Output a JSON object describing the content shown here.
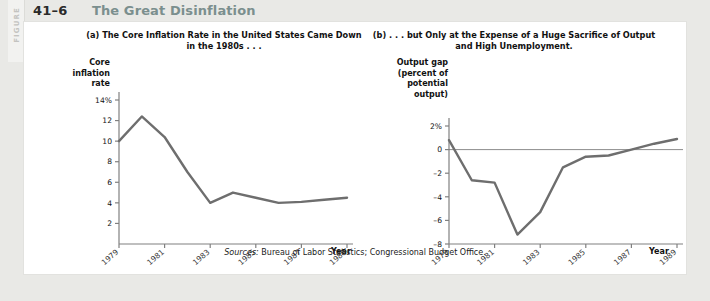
{
  "header": {
    "figure_word": "FIGURE",
    "figure_number": "41–6",
    "figure_title": "The Great Disinflation"
  },
  "source_note": {
    "label": "Sources:",
    "text": " Bureau of Labor Statistics; Congressional Budget Office."
  },
  "panel_a": {
    "title": "(a) The Core Inflation Rate in the United States Came Down in the 1980s . . .",
    "y_caption": "Core inflation rate",
    "x_caption": "Year"
  },
  "panel_b": {
    "title": "(b) . . . but Only at the Expense of a Huge Sacrifice of Output and High Unemployment.",
    "y_caption": "Output gap (percent of potential output)",
    "x_caption": "Year"
  },
  "colors": {
    "line": "#6e6e6e",
    "axis": "#808080",
    "card": "#ffffff",
    "page": "#e9e9e6",
    "title_accent": "#7b8f8e",
    "figure_word": "#c3c3c0"
  },
  "chart_data": [
    {
      "type": "line",
      "title": "(a) The Core Inflation Rate in the United States Came Down in the 1980s . . .",
      "xlabel": "Year",
      "ylabel": "Core inflation rate",
      "xlim": [
        1979,
        1989
      ],
      "ylim": [
        0,
        14
      ],
      "yticks": [
        2,
        4,
        6,
        8,
        10,
        12,
        14
      ],
      "ytick_labels": [
        "2",
        "4",
        "6",
        "8",
        "10",
        "12",
        "14%"
      ],
      "xticks": [
        1979,
        1981,
        1983,
        1985,
        1987,
        1989
      ],
      "xtick_labels": [
        "1979",
        "1981",
        "1983",
        "1985",
        "1987",
        "1989"
      ],
      "grid": false,
      "legend": "none",
      "x": [
        1979,
        1980,
        1981,
        1982,
        1983,
        1984,
        1985,
        1986,
        1987,
        1988,
        1989
      ],
      "values": [
        10.0,
        12.4,
        10.4,
        7.0,
        4.0,
        5.0,
        4.5,
        4.0,
        4.1,
        4.3,
        4.5
      ]
    },
    {
      "type": "line",
      "title": "(b) . . . but Only at the Expense of a Huge Sacrifice of Output and High Unemployment.",
      "xlabel": "Year",
      "ylabel": "Output gap (percent of potential output)",
      "xlim": [
        1979,
        1989
      ],
      "ylim": [
        -8,
        2
      ],
      "yticks": [
        -8,
        -6,
        -4,
        -2,
        0,
        2
      ],
      "ytick_labels": [
        "–8",
        "–6",
        "–4",
        "–2",
        "0",
        "2%"
      ],
      "xticks": [
        1979,
        1981,
        1983,
        1985,
        1987,
        1989
      ],
      "xtick_labels": [
        "1979",
        "1981",
        "1983",
        "1985",
        "1987",
        "1989"
      ],
      "grid": false,
      "zero_line": true,
      "legend": "none",
      "x": [
        1979,
        1980,
        1981,
        1982,
        1983,
        1984,
        1985,
        1986,
        1987,
        1988,
        1989
      ],
      "values": [
        0.8,
        -2.6,
        -2.8,
        -7.2,
        -5.3,
        -1.5,
        -0.6,
        -0.5,
        0.0,
        0.5,
        0.9
      ]
    }
  ]
}
